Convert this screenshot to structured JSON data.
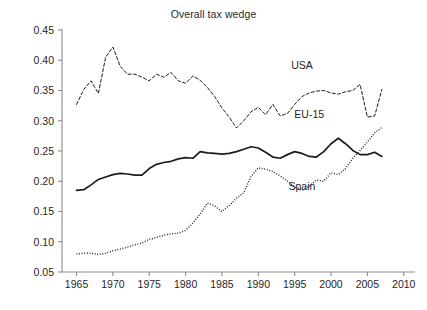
{
  "chart_data": {
    "type": "line",
    "title": "Overall tax wedge",
    "xlabel": "",
    "ylabel": "",
    "xlim": [
      1963,
      2011
    ],
    "ylim": [
      0.05,
      0.45
    ],
    "xticks": [
      1965,
      1970,
      1975,
      1980,
      1985,
      1990,
      1995,
      2000,
      2005,
      2010
    ],
    "xtick_labels": [
      "1965",
      "1970",
      "1975",
      "1980",
      "1985",
      "1990",
      "1995",
      "2000",
      "2005",
      "2010"
    ],
    "yticks": [
      0.05,
      0.1,
      0.15,
      0.2,
      0.25,
      0.3,
      0.35,
      0.4,
      0.45
    ],
    "ytick_labels": [
      "0.05",
      "0.10",
      "0.15",
      "0.20",
      "0.25",
      "0.30",
      "0.35",
      "0.40",
      "0.45"
    ],
    "grid": false,
    "legend_position": "inline-annotations",
    "line_color": "#1c1c1c",
    "series": [
      {
        "name": "USA",
        "style": "dashed",
        "label_x": 1996,
        "label_y": 0.385,
        "x": [
          1965,
          1966,
          1967,
          1968,
          1969,
          1970,
          1971,
          1972,
          1973,
          1974,
          1975,
          1976,
          1977,
          1978,
          1979,
          1980,
          1981,
          1982,
          1983,
          1984,
          1985,
          1986,
          1987,
          1988,
          1989,
          1990,
          1991,
          1992,
          1993,
          1994,
          1995,
          1996,
          1997,
          1998,
          1999,
          2000,
          2001,
          2002,
          2003,
          2004,
          2005,
          2006,
          2007
        ],
        "y": [
          0.327,
          0.352,
          0.366,
          0.345,
          0.405,
          0.422,
          0.39,
          0.377,
          0.377,
          0.372,
          0.366,
          0.377,
          0.372,
          0.38,
          0.366,
          0.362,
          0.374,
          0.367,
          0.355,
          0.34,
          0.321,
          0.306,
          0.288,
          0.3,
          0.315,
          0.322,
          0.31,
          0.327,
          0.308,
          0.312,
          0.327,
          0.34,
          0.346,
          0.349,
          0.35,
          0.346,
          0.344,
          0.348,
          0.35,
          0.36,
          0.306,
          0.308,
          0.352
        ]
      },
      {
        "name": "EU-15",
        "style": "solid",
        "label_x": 1997,
        "label_y": 0.305,
        "x": [
          1965,
          1966,
          1967,
          1968,
          1969,
          1970,
          1971,
          1972,
          1973,
          1974,
          1975,
          1976,
          1977,
          1978,
          1979,
          1980,
          1981,
          1982,
          1983,
          1984,
          1985,
          1986,
          1987,
          1988,
          1989,
          1990,
          1991,
          1992,
          1993,
          1994,
          1995,
          1996,
          1997,
          1998,
          1999,
          2000,
          2001,
          2002,
          2003,
          2004,
          2005,
          2006,
          2007
        ],
        "y": [
          0.185,
          0.186,
          0.194,
          0.203,
          0.207,
          0.211,
          0.213,
          0.212,
          0.21,
          0.21,
          0.221,
          0.228,
          0.231,
          0.233,
          0.237,
          0.239,
          0.238,
          0.249,
          0.247,
          0.246,
          0.245,
          0.246,
          0.249,
          0.253,
          0.257,
          0.255,
          0.248,
          0.24,
          0.238,
          0.244,
          0.249,
          0.246,
          0.241,
          0.24,
          0.249,
          0.262,
          0.271,
          0.262,
          0.251,
          0.244,
          0.244,
          0.248,
          0.241
        ]
      },
      {
        "name": "Spain",
        "style": "dotted",
        "label_x": 1996,
        "label_y": 0.185,
        "x": [
          1965,
          1966,
          1967,
          1968,
          1969,
          1970,
          1971,
          1972,
          1973,
          1974,
          1975,
          1976,
          1977,
          1978,
          1979,
          1980,
          1981,
          1982,
          1983,
          1984,
          1985,
          1986,
          1987,
          1988,
          1989,
          1990,
          1991,
          1992,
          1993,
          1994,
          1995,
          1996,
          1997,
          1998,
          1999,
          2000,
          2001,
          2002,
          2003,
          2004,
          2005,
          2006,
          2007
        ],
        "y": [
          0.08,
          0.081,
          0.081,
          0.079,
          0.081,
          0.085,
          0.088,
          0.091,
          0.095,
          0.098,
          0.104,
          0.107,
          0.111,
          0.113,
          0.114,
          0.119,
          0.131,
          0.146,
          0.164,
          0.159,
          0.15,
          0.16,
          0.172,
          0.181,
          0.208,
          0.222,
          0.22,
          0.216,
          0.209,
          0.2,
          0.191,
          0.185,
          0.192,
          0.202,
          0.2,
          0.214,
          0.211,
          0.221,
          0.238,
          0.251,
          0.265,
          0.28,
          0.289
        ]
      }
    ]
  },
  "caption": ""
}
